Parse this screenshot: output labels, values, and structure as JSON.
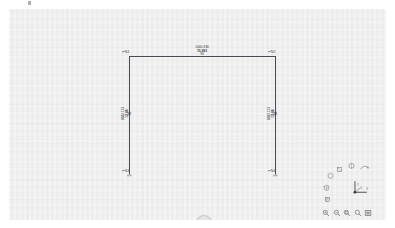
{
  "app": {
    "title": "Structural Frame Model View",
    "viewport_label": "3d-model-viewport"
  },
  "model": {
    "nodes": [
      {
        "id": "n1",
        "label": "N1",
        "position": "top-left"
      },
      {
        "id": "n2",
        "label": "N2",
        "position": "top-right"
      },
      {
        "id": "n3",
        "label": "N3",
        "position": "bottom-left"
      },
      {
        "id": "n4",
        "label": "N4",
        "position": "bottom-right"
      }
    ],
    "members": [
      {
        "id": "beam-top",
        "type": "beam",
        "orientation": "horizontal",
        "annotation": {
          "line1": "1040.336",
          "line2": "70.283",
          "line3": "90"
        }
      },
      {
        "id": "column-left",
        "type": "column",
        "orientation": "vertical",
        "annotation": {
          "line1": "1083.772",
          "line2": "72.88",
          "line3": "90"
        }
      },
      {
        "id": "column-right",
        "type": "column",
        "orientation": "vertical",
        "annotation": {
          "line1": "1083.772",
          "line2": "72.88",
          "line3": "90"
        }
      }
    ]
  },
  "axis_triad": {
    "x_label": "X",
    "y_label": "Y",
    "z_label": "Z"
  },
  "nav_toolbar": {
    "icons": [
      {
        "name": "view-iso-icon",
        "label": "Isometric View"
      },
      {
        "name": "view-top-icon",
        "label": "Top View"
      },
      {
        "name": "view-front-icon",
        "label": "Front View"
      },
      {
        "name": "view-side-icon",
        "label": "Side View"
      },
      {
        "name": "view-rotate-icon",
        "label": "Rotate View"
      },
      {
        "name": "view-pan-icon",
        "label": "Pan View"
      }
    ]
  },
  "zoom_toolbar": {
    "icons": [
      {
        "name": "zoom-in-icon",
        "label": "Zoom In"
      },
      {
        "name": "zoom-out-icon",
        "label": "Zoom Out"
      },
      {
        "name": "zoom-window-icon",
        "label": "Zoom Window"
      },
      {
        "name": "zoom-extents-icon",
        "label": "Zoom Extents"
      },
      {
        "name": "zoom-fit-icon",
        "label": "Fit To View"
      }
    ]
  },
  "colors": {
    "canvas_bg": "#ededed",
    "page_bg": "#ffffff",
    "member_stroke": "#4a4a52",
    "text": "#2e2e36",
    "icon": "#6f6f78"
  }
}
